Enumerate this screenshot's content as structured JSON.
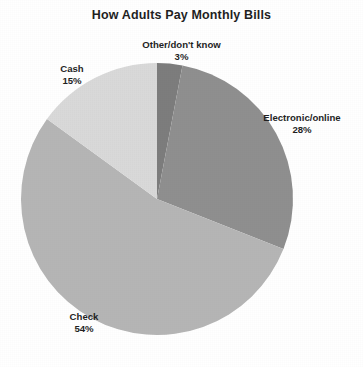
{
  "chart_data": {
    "type": "pie",
    "title": "How Adults Pay Monthly Bills",
    "xlabel": "",
    "ylabel": "",
    "legend": "none",
    "grid": false,
    "units": "percent",
    "labels_show_name": true,
    "labels_show_percent": true,
    "start_angle_deg": 0,
    "direction": "clockwise",
    "categories": [
      "Other/don't know",
      "Electronic/online",
      "Check",
      "Cash"
    ],
    "values": [
      3,
      28,
      54,
      15
    ],
    "slices": [
      {
        "name": "Other/don't know",
        "value": 3,
        "percent_label": "3%",
        "color": "#7d7d7d",
        "start_deg": 0,
        "end_deg": 10.8
      },
      {
        "name": "Electronic/online",
        "value": 28,
        "percent_label": "28%",
        "color": "#8f8f8f",
        "start_deg": 10.8,
        "end_deg": 111.6
      },
      {
        "name": "Check",
        "value": 54,
        "percent_label": "54%",
        "color": "#b5b5b5",
        "start_deg": 111.6,
        "end_deg": 306.0
      },
      {
        "name": "Cash",
        "value": 15,
        "percent_label": "15%",
        "color": "#d9d9d9",
        "start_deg": 306.0,
        "end_deg": 360.0
      }
    ]
  },
  "figure": {
    "title": "How Adults Pay Monthly Bills",
    "background_color": "#ffffff",
    "text_color": "#1f1f1f",
    "center_x": 157,
    "center_y": 199,
    "radius": 136
  },
  "labels": {
    "other": {
      "name": "Other/don't know",
      "percent": "3%"
    },
    "cash": {
      "name": "Cash",
      "percent": "15%"
    },
    "electronic": {
      "name": "Electronic/online",
      "percent": "28%"
    },
    "check": {
      "name": "Check",
      "percent": "54%"
    }
  }
}
